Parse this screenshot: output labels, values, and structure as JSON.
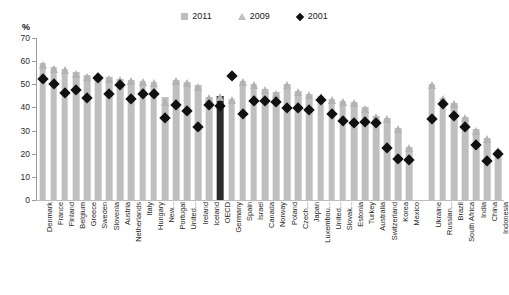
{
  "chart_data": {
    "type": "bar",
    "title": "",
    "subtitle": "",
    "xlabel": "",
    "ylabel": "",
    "unit_label": "%",
    "ylim": [
      0,
      70
    ],
    "ytick_step": 10,
    "yticks": [
      "0",
      "10",
      "20",
      "30",
      "40",
      "50",
      "60",
      "70"
    ],
    "grid": false,
    "legend_position": "top-center",
    "highlight_category": "OECD",
    "colors": {
      "bar_2011": "#bfbfbf",
      "bar_2011_highlight": "#2b2b2b",
      "marker_2009": "#b3b3b3",
      "marker_2001": "#111111",
      "axis": "#9a9a9a",
      "text": "#1f1f1f"
    },
    "series": [
      {
        "name": "2011",
        "marker": "square",
        "values": [
          59.0,
          57.5,
          56.5,
          55.5,
          54.0,
          53.5,
          53.0,
          52.5,
          52.0,
          51.5,
          51.0,
          44.5,
          52.0,
          51.0,
          49.5,
          44.5,
          45.0,
          43.5,
          51.5,
          50.0,
          48.0,
          46.5,
          50.0,
          47.0,
          46.0,
          45.0,
          43.5,
          43.0,
          42.5,
          40.0,
          36.5,
          35.5,
          31.0,
          23.0,
          null,
          50.0,
          44.0,
          42.0,
          36.0,
          30.5,
          27.0,
          21.5
        ]
      },
      {
        "name": "2009",
        "marker": "triangle",
        "values": [
          58.5,
          56.5,
          56.0,
          54.5,
          53.0,
          53.0,
          52.5,
          52.0,
          51.5,
          51.0,
          50.5,
          42.5,
          51.5,
          50.5,
          49.0,
          44.0,
          44.5,
          43.0,
          51.0,
          49.5,
          47.5,
          46.0,
          49.5,
          46.5,
          45.5,
          44.5,
          43.0,
          42.5,
          42.0,
          39.5,
          36.0,
          35.0,
          30.5,
          22.5,
          null,
          49.5,
          43.5,
          41.5,
          35.5,
          30.0,
          26.5,
          21.0
        ]
      },
      {
        "name": "2001",
        "marker": "diamond",
        "values": [
          54.0,
          51.8,
          48.0,
          49.2,
          46.0,
          54.5,
          47.5,
          51.5,
          45.3,
          47.8,
          47.8,
          37.3,
          43.0,
          40.3,
          33.5,
          42.8,
          42.5,
          55.5,
          39.0,
          44.5,
          44.5,
          44.0,
          41.5,
          41.5,
          40.5,
          45.0,
          39.0,
          36.0,
          35.0,
          35.5,
          35.0,
          24.5,
          19.5,
          19.0,
          null,
          37.0,
          43.5,
          38.0,
          33.5,
          25.5,
          18.5,
          21.5
        ]
      }
    ],
    "categories": [
      "Denmark",
      "France",
      "Finland",
      "Belgium",
      "Greece",
      "Sweden",
      "Slovenia",
      "Austria",
      "Netherlands",
      "Italy",
      "Hungary",
      "New...",
      "Portugal",
      "United...",
      "Ireland",
      "Iceland",
      "OECD",
      "Germany",
      "Spain",
      "Israel",
      "Canada",
      "Norway",
      "Poland",
      "Czech...",
      "Japan",
      "Luxembou...",
      "United...",
      "Slovak...",
      "Estonia",
      "Turkey",
      "Australia",
      "Switzerland",
      "Korea",
      "Mexico",
      "",
      "Ukraine",
      "Russian...",
      "Brazil",
      "South Africa",
      "India",
      "China",
      "Indonesia"
    ]
  },
  "legend": {
    "items": [
      {
        "label": "2011",
        "marker": "square"
      },
      {
        "label": "2009",
        "marker": "triangle"
      },
      {
        "label": "2001",
        "marker": "diamond"
      }
    ]
  }
}
